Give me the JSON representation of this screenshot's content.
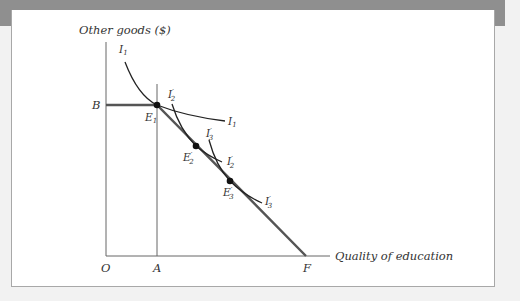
{
  "figure": {
    "y_axis_label": "Other goods ($)",
    "x_axis_label": "Quality of education",
    "origin_label": "O",
    "points": {
      "B": "B",
      "A": "A",
      "F": "F",
      "E1": {
        "base": "E",
        "sub": "1"
      },
      "E2p": {
        "base": "E",
        "sup": "′",
        "sub": "2"
      },
      "E3p": {
        "base": "E",
        "sup": "′",
        "sub": "3"
      }
    },
    "curves": {
      "I1_top": {
        "base": "I",
        "sub": "1"
      },
      "I1_end": {
        "base": "I",
        "sub": "1"
      },
      "I2p_top": {
        "base": "I",
        "sup": "′",
        "sub": "2"
      },
      "I2p_end": {
        "base": "I",
        "sup": "′",
        "sub": "2"
      },
      "I3p_top": {
        "base": "I",
        "sup": "′",
        "sub": "3"
      },
      "I3p_end": {
        "base": "I",
        "sup": "′",
        "sub": "3"
      }
    },
    "colors": {
      "axis": "#555555",
      "budget_line": "#555555",
      "curve": "#222222",
      "point": "#111111",
      "frame": "#8f8f8f"
    }
  }
}
